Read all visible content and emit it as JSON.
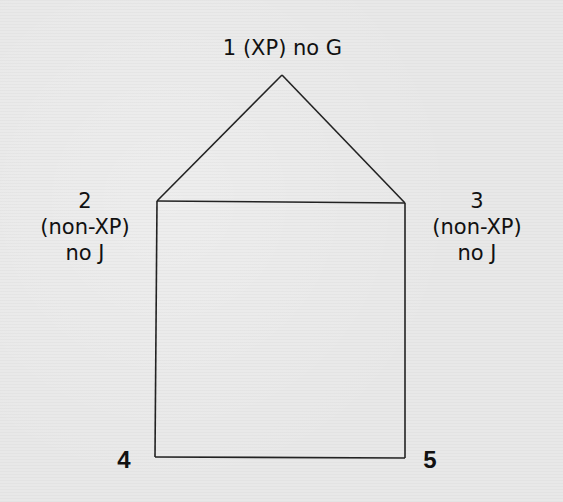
{
  "diagram": {
    "type": "graph",
    "shape": "house",
    "nodes": [
      {
        "id": 1,
        "number": "1",
        "line1": "1 (XP) no G"
      },
      {
        "id": 2,
        "number": "2",
        "type_label": "(non-XP)",
        "constraint": "no J"
      },
      {
        "id": 3,
        "number": "3",
        "type_label": "(non-XP)",
        "constraint": "no J"
      },
      {
        "id": 4,
        "number": "4"
      },
      {
        "id": 5,
        "number": "5"
      }
    ],
    "edges": [
      [
        1,
        2
      ],
      [
        1,
        3
      ],
      [
        2,
        3
      ],
      [
        2,
        4
      ],
      [
        3,
        5
      ],
      [
        4,
        5
      ]
    ],
    "colors": {
      "line": "#222222",
      "background": "#e8e8e8",
      "text": "#111111"
    }
  }
}
